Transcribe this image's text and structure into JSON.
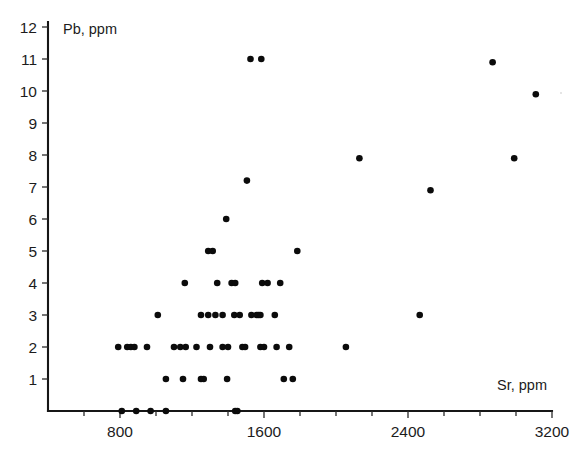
{
  "chart_data": {
    "type": "scatter",
    "title": "",
    "xlabel": "Sr, ppm",
    "ylabel": "Pb, ppm",
    "xlim": [
      400,
      3200
    ],
    "ylim": [
      0,
      12
    ],
    "xticks": [
      800,
      1600,
      2400,
      3200
    ],
    "xtick_labels": [
      "800",
      "1600",
      "2400",
      "3200"
    ],
    "x_minor_ticks": [
      600,
      1000,
      1200,
      1400,
      1800,
      2000,
      2200,
      2600,
      2800,
      3000
    ],
    "yticks": [
      1,
      2,
      3,
      4,
      5,
      6,
      7,
      8,
      9,
      10,
      11,
      12
    ],
    "ytick_labels": [
      "1",
      "2",
      "3",
      "4",
      "5",
      "6",
      "7",
      "8",
      "9",
      "10",
      "11",
      "12"
    ],
    "grid": false,
    "legend": null,
    "marker": "filled-circle",
    "marker_color": "#0b0b0b",
    "marker_size": 4.4,
    "points": [
      [
        810,
        0
      ],
      [
        890,
        0
      ],
      [
        970,
        0
      ],
      [
        1055,
        0
      ],
      [
        1440,
        0
      ],
      [
        1452,
        0
      ],
      [
        1055,
        1
      ],
      [
        1150,
        1
      ],
      [
        1250,
        1
      ],
      [
        1265,
        1
      ],
      [
        1395,
        1
      ],
      [
        1710,
        1
      ],
      [
        1760,
        1
      ],
      [
        790,
        2
      ],
      [
        840,
        2
      ],
      [
        860,
        2
      ],
      [
        880,
        2
      ],
      [
        950,
        2
      ],
      [
        1100,
        2
      ],
      [
        1135,
        2
      ],
      [
        1165,
        2
      ],
      [
        1225,
        2
      ],
      [
        1300,
        2
      ],
      [
        1370,
        2
      ],
      [
        1400,
        2
      ],
      [
        1480,
        2
      ],
      [
        1495,
        2
      ],
      [
        1580,
        2
      ],
      [
        1600,
        2
      ],
      [
        1670,
        2
      ],
      [
        1740,
        2
      ],
      [
        2055,
        2
      ],
      [
        1010,
        3
      ],
      [
        1250,
        3
      ],
      [
        1290,
        3
      ],
      [
        1330,
        3
      ],
      [
        1370,
        3
      ],
      [
        1435,
        3
      ],
      [
        1465,
        3
      ],
      [
        1530,
        3
      ],
      [
        1560,
        3
      ],
      [
        1570,
        3
      ],
      [
        1580,
        3
      ],
      [
        1660,
        3
      ],
      [
        2465,
        3
      ],
      [
        1160,
        4
      ],
      [
        1340,
        4
      ],
      [
        1420,
        4
      ],
      [
        1440,
        4
      ],
      [
        1590,
        4
      ],
      [
        1620,
        4
      ],
      [
        1690,
        4
      ],
      [
        1290,
        5
      ],
      [
        1315,
        5
      ],
      [
        1785,
        5
      ],
      [
        1390,
        6
      ],
      [
        1505,
        7.2
      ],
      [
        2130,
        7.9
      ],
      [
        2990,
        7.9
      ],
      [
        2525,
        6.9
      ],
      [
        1525,
        11
      ],
      [
        1585,
        11
      ],
      [
        2870,
        10.9
      ],
      [
        3110,
        9.9
      ]
    ]
  },
  "caption": {
    "text": ""
  }
}
